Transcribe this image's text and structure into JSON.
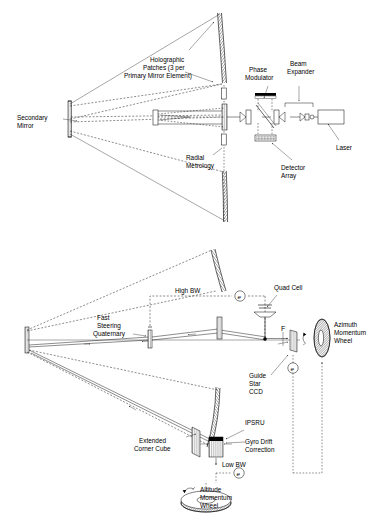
{
  "figure": {
    "background_color": "#ffffff",
    "ink_color": "#000000"
  },
  "panel_top": {
    "name": "Holographic primary mirror metrology layout",
    "labels": {
      "secondary_mirror": "Secondary\nMirror",
      "secondary_mirror_l1": "Secondary",
      "secondary_mirror_l2": "Mirror",
      "holographic_patches_l1": "Holographic",
      "holographic_patches_l2": "Patches (3 per",
      "holographic_patches_l3": "Primary Mirror Element)",
      "radial_metrology_l1": "Radial",
      "radial_metrology_l2": "Metrology",
      "phase_modulator_l1": "Phase",
      "phase_modulator_l2": "Modulator",
      "beam_expander_l1": "Beam",
      "beam_expander_l2": "Expander",
      "detector_array_l1": "Detector",
      "detector_array_l2": "Array",
      "laser": "Laser"
    }
  },
  "panel_bottom": {
    "name": "Guide star and momentum wheel pointing control layout",
    "labels": {
      "high_bw": "High BW",
      "low_bw": "Low BW",
      "quad_cell": "Quad Cell",
      "fast_steering_l1": "Fast",
      "fast_steering_l2": "Steering",
      "fast_steering_l3": "Quaternary",
      "azimuth_wheel_l1": "Azimuth",
      "azimuth_wheel_l2": "Momentum",
      "azimuth_wheel_l3": "Wheel",
      "altitude_wheel_l1": "Altitude",
      "altitude_wheel_l2": "Momentum",
      "altitude_wheel_l3": "Wheel",
      "guide_star_l1": "Guide",
      "guide_star_l2": "Star",
      "guide_star_l3": "CCD",
      "extended_corner_l1": "Extended",
      "extended_corner_l2": "Corner Cube",
      "ipsru": "IPSRU",
      "gyro_drift_l1": "Gyro Drift",
      "gyro_drift_l2": "Correction",
      "focus_marker": "F",
      "error_symbol": "e"
    }
  }
}
